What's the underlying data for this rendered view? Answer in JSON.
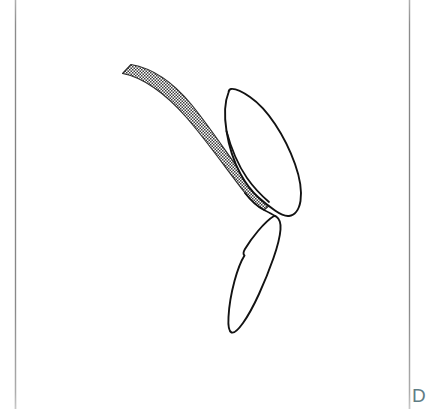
{
  "page": {
    "kind": "scanned-figure-page",
    "background_color": "#ffffff",
    "width": 431,
    "height": 409
  },
  "margins": {
    "left_rule_x": 15,
    "right_rule_x": 409,
    "rule_color": "#7e7e7e"
  },
  "caption": {
    "text": "D",
    "color": "#5f7d85"
  },
  "figure": {
    "title": "",
    "line_color": "#1a1a1a",
    "fill_color": "#ffffff",
    "stipple_color": "#4a4a4a",
    "parts": [
      {
        "name": "stippled-band",
        "label": "",
        "fill": "stipple",
        "description": "curved tapering band running from upper-left down to centre"
      },
      {
        "name": "upper-lobe",
        "label": "",
        "fill": "white",
        "description": "upper elongated leaf-shaped outline"
      },
      {
        "name": "lower-lobe",
        "label": "",
        "fill": "white",
        "description": "lower elongated leaf-shaped outline"
      }
    ]
  }
}
